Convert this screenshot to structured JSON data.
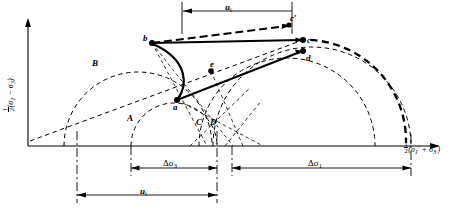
{
  "figure": {
    "type": "mohr-circle-stress-path-diagram",
    "axes": {
      "y_label_parts": {
        "half": "1/2",
        "open": "(",
        "s1": "σ",
        "s1sub": "1",
        "minus": " − ",
        "s3": "σ",
        "s3sub": "3",
        "close": ")"
      },
      "y_label_text": "½(σ₁ − σ₃)",
      "x_label_text": "½(σ₁′ + σ₃′)",
      "x_axis_y": 146,
      "y_axis_x": 28,
      "origin": {
        "x": 28,
        "y": 146
      }
    },
    "points": [
      {
        "name": "a",
        "label": "a",
        "x": 177,
        "y": 100,
        "label_dx": -4,
        "label_dy": 9,
        "filled": true
      },
      {
        "name": "b",
        "label": "b",
        "x": 152,
        "y": 43,
        "label_dx": -9,
        "label_dy": -2,
        "filled": true
      },
      {
        "name": "c",
        "label": "c",
        "x": 303,
        "y": 40,
        "label_dx": 4,
        "label_dy": 2,
        "filled": true
      },
      {
        "name": "c-prime",
        "label": "c′",
        "x": 289,
        "y": 25,
        "label_dx": 1,
        "label_dy": -4,
        "filled": true
      },
      {
        "name": "d",
        "label": "d",
        "x": 303,
        "y": 51,
        "label_dx": 3,
        "label_dy": 10,
        "filled": true
      },
      {
        "name": "e",
        "label": "e",
        "x": 211,
        "y": 71,
        "label_dx": -1,
        "label_dy": -4,
        "filled": true
      }
    ],
    "curve_labels": [
      {
        "name": "A",
        "label": "A",
        "x": 127,
        "y": 118
      },
      {
        "name": "B",
        "label": "B",
        "x": 92,
        "y": 63
      },
      {
        "name": "C",
        "label": "C",
        "x": 196,
        "y": 122
      },
      {
        "name": "D",
        "label": "D",
        "x": 210,
        "y": 122
      }
    ],
    "dimensions": [
      {
        "name": "u-i-top",
        "label": "u",
        "sub": "i",
        "x1": 182,
        "x2": 292,
        "y": 11,
        "label_x": 228,
        "label_y": 4
      },
      {
        "name": "delta-sigma-3",
        "label": "Δσ",
        "sub": "3",
        "x1": 131,
        "x2": 217,
        "y": 168,
        "label_x": 167,
        "label_y": 161
      },
      {
        "name": "delta-sigma-1",
        "label": "Δσ",
        "sub": "1",
        "x1": 232,
        "x2": 411,
        "y": 168,
        "label_x": 312,
        "label_y": 161
      },
      {
        "name": "u-i-bottom",
        "label": "u",
        "sub": "i",
        "x1": 77,
        "x2": 217,
        "y": 195,
        "label_x": 143,
        "label_y": 188
      }
    ]
  }
}
